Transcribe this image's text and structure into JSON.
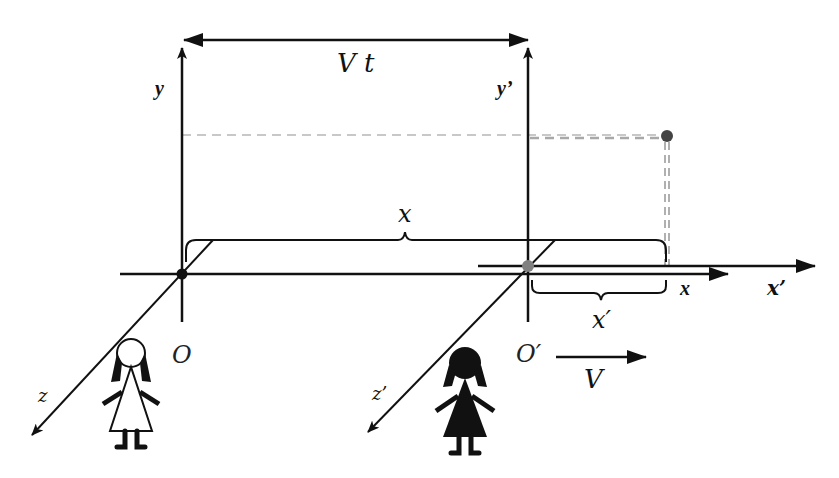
{
  "diagram": {
    "labels": {
      "displacement": "V t",
      "y_axis": "y",
      "y_prime_axis": "y’",
      "x_axis": "x",
      "x_prime_axis": "x’",
      "z_axis": "z",
      "z_prime_axis": "z’",
      "brace_x": "x",
      "brace_x_prime": "x′",
      "origin": "O",
      "origin_prime": "O′",
      "velocity": "V"
    },
    "figures": [
      {
        "name": "observer-at-rest",
        "style": "outline"
      },
      {
        "name": "observer-moving",
        "style": "filled"
      }
    ],
    "colors": {
      "ink": "#111111",
      "dashed_light": "#c8c8c8",
      "dashed_dark": "#a0a0a0",
      "event_point": "#444444",
      "origin_prime_point": "#808080"
    }
  }
}
